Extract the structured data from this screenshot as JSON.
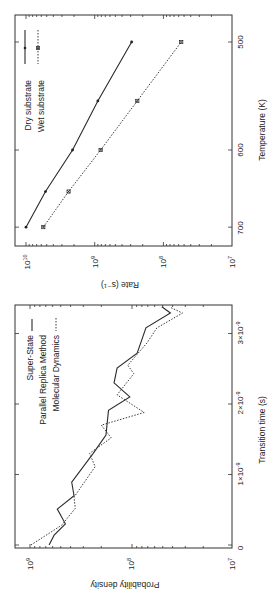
{
  "chart_data": [
    {
      "type": "line",
      "title": "",
      "orientation": "rotated-90-ccw",
      "xlabel": "Temperature (K)",
      "ylabel": "Rate (s⁻¹)",
      "x_scale": "inverse (1/T)",
      "y_scale": "log",
      "xlim": [
        500,
        700
      ],
      "ylim": [
        10000000.0,
        10000000000.0
      ],
      "x_ticks": [
        "700",
        "600",
        "500"
      ],
      "y_ticks": [
        "10^10",
        "10^9",
        "10^8",
        "10^7"
      ],
      "grid": false,
      "legend_position": "upper right (rotated)",
      "series": [
        {
          "name": "Dry substrate",
          "style": "solid",
          "marker": "dot",
          "x": [
            700,
            650,
            600,
            550,
            500
          ],
          "values": [
            10000000000.0,
            5200000000.0,
            2100000000.0,
            900000000.0,
            290000000.0
          ]
        },
        {
          "name": "Wet substrate",
          "style": "dotted",
          "marker": "x-square",
          "x": [
            700,
            650,
            600,
            550,
            500
          ],
          "values": [
            5600000000.0,
            2400000000.0,
            820000000.0,
            240000000.0,
            55000000.0
          ]
        }
      ]
    },
    {
      "type": "line",
      "title": "",
      "orientation": "rotated-90-ccw",
      "xlabel": "Transition time (s)",
      "ylabel": "Probability density",
      "x_scale": "linear",
      "y_scale": "log",
      "xlim": [
        0,
        3.38e-09
      ],
      "ylim": [
        10000000.0,
        1500000000.0
      ],
      "x_ticks": [
        "0",
        "1×10^-9",
        "2×10^-9",
        "3×10^-9"
      ],
      "y_ticks": [
        "10^9",
        "10^8",
        "10^7"
      ],
      "grid": false,
      "legend_position": "upper left (rotated)",
      "series": [
        {
          "name": "Super-State Parallel Replica Method",
          "style": "solid",
          "x": [
            0,
            1.4e-10,
            3e-10,
            5.1e-10,
            7e-10,
            8.9e-10,
            1.3e-09,
            1.56e-09,
            1.91e-09,
            2.1e-09,
            2.3e-09,
            2.51e-09,
            2.72e-09,
            3.08e-09,
            3.29e-09,
            3.38e-09
          ],
          "values": [
            650000000.0,
            580000000.0,
            450000000.0,
            540000000.0,
            370000000.0,
            390000000.0,
            240000000.0,
            180000000.0,
            170000000.0,
            105000000.0,
            150000000.0,
            140000000.0,
            89000000.0,
            73000000.0,
            42000000.0,
            51000000.0
          ]
        },
        {
          "name": "Molecular Dynamics",
          "style": "dotted",
          "x": [
            0,
            2.8e-10,
            5.2e-10,
            6.8e-10,
            1.11e-09,
            1.3e-09,
            1.52e-09,
            1.7e-09,
            1.88e-09,
            2.13e-09,
            2.43e-09,
            2.55e-09,
            2.87e-09,
            3.08e-09,
            3.29e-09,
            3.37e-09
          ],
          "values": [
            980000000.0,
            490000000.0,
            360000000.0,
            370000000.0,
            230000000.0,
            260000000.0,
            160000000.0,
            200000000.0,
            76000000.0,
            140000000.0,
            96000000.0,
            110000000.0,
            71000000.0,
            57000000.0,
            32000000.0,
            42000000.0
          ]
        }
      ]
    }
  ],
  "rate_chart": {
    "xlabel": "Temperature (K)",
    "ylabel": "Rate (s⁻¹)",
    "x_tick_labels": [
      "700",
      "600",
      "500"
    ],
    "y_tick_bases": [
      "10",
      "10",
      "10",
      "10"
    ],
    "y_tick_exps": [
      "10",
      "9",
      "8",
      "7"
    ],
    "legend": [
      "Dry substrate",
      "Wet substrate"
    ]
  },
  "density_chart": {
    "xlabel": "Transition time (s)",
    "ylabel": "Probability density",
    "x_tick_labels": [
      "0",
      "1×10",
      "2×10",
      "3×10"
    ],
    "x_tick_exps": [
      "",
      "-9",
      "-9",
      "-9"
    ],
    "y_tick_bases": [
      "10",
      "10",
      "10"
    ],
    "y_tick_exps": [
      "9",
      "8",
      "7"
    ],
    "legend": [
      "Super-State",
      "Parallel Replica Method",
      "Molecular Dynamics"
    ]
  }
}
